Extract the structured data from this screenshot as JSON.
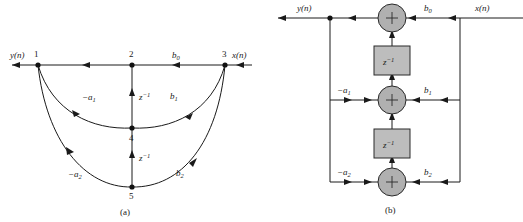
{
  "figure": {
    "panels": [
      {
        "id": "a",
        "caption": "(a)",
        "kind": "signal-flow-graph"
      },
      {
        "id": "b",
        "caption": "(b)",
        "kind": "block-diagram"
      }
    ],
    "colors": {
      "line": "#1a1a1a",
      "sum_fill": "#b0b0b0",
      "delay_fill": "#bdbdbd",
      "background": "#ffffff"
    }
  },
  "panel_a": {
    "caption": "(a)",
    "signals": {
      "output": "y(n)",
      "input": "x(n)"
    },
    "nodes": [
      {
        "id": "1",
        "label": "1"
      },
      {
        "id": "2",
        "label": "2"
      },
      {
        "id": "3",
        "label": "3"
      },
      {
        "id": "4",
        "label": "4"
      },
      {
        "id": "5",
        "label": "5"
      }
    ],
    "branch_labels": {
      "b0": "b",
      "b0_sub": "0",
      "b1": "b",
      "b1_sub": "1",
      "b2": "b",
      "b2_sub": "2",
      "a1": "−a",
      "a1_sub": "1",
      "a2": "−a",
      "a2_sub": "2",
      "delay1": "z",
      "delay1_sup": "−1",
      "delay2": "z",
      "delay2_sup": "−1"
    }
  },
  "panel_b": {
    "caption": "(b)",
    "signals": {
      "output": "y(n)",
      "input": "x(n)"
    },
    "adders": [
      {
        "id": "adder-top",
        "symbol": "+"
      },
      {
        "id": "adder-middle",
        "symbol": "+"
      },
      {
        "id": "adder-bottom",
        "symbol": "+"
      }
    ],
    "delays": [
      {
        "id": "delay-upper",
        "base": "z",
        "exponent": "−1"
      },
      {
        "id": "delay-lower",
        "base": "z",
        "exponent": "−1"
      }
    ],
    "coefficients": {
      "b0": "b",
      "b0_sub": "0",
      "b1": "b",
      "b1_sub": "1",
      "b2": "b",
      "b2_sub": "2",
      "a1": "−a",
      "a1_sub": "1",
      "a2": "−a",
      "a2_sub": "2"
    }
  }
}
